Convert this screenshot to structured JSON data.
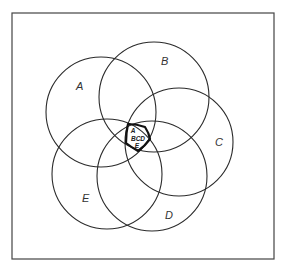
{
  "diagram": {
    "type": "five-set venn diagram",
    "sets": [
      {
        "id": "A",
        "label": "A",
        "cx": 101,
        "cy": 112,
        "r": 55,
        "label_x": 76,
        "label_y": 90
      },
      {
        "id": "B",
        "label": "B",
        "cx": 154,
        "cy": 97,
        "r": 55,
        "label_x": 161,
        "label_y": 65
      },
      {
        "id": "C",
        "label": "C",
        "cx": 179,
        "cy": 142,
        "r": 54,
        "label_x": 215,
        "label_y": 146
      },
      {
        "id": "D",
        "label": "D",
        "cx": 152,
        "cy": 176,
        "r": 55,
        "label_x": 165,
        "label_y": 219
      },
      {
        "id": "E",
        "label": "E",
        "cx": 107,
        "cy": 174,
        "r": 55,
        "label_x": 82,
        "label_y": 202
      }
    ],
    "intersection": {
      "lines": [
        "A",
        "BCD",
        "E"
      ],
      "description": "central region common to all five sets"
    }
  }
}
